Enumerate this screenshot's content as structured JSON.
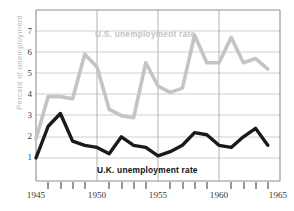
{
  "chart_data": {
    "type": "line",
    "title": "",
    "subtitle": "",
    "xlabel": "",
    "ylabel": "Percent of unemployment",
    "xlim": [
      1945,
      1965
    ],
    "ylim": [
      0.35,
      7.6
    ],
    "grid": true,
    "legend_position": "inline-annotation",
    "x": [
      1945,
      1946,
      1947,
      1948,
      1949,
      1950,
      1951,
      1952,
      1953,
      1954,
      1955,
      1956,
      1957,
      1958,
      1959,
      1960,
      1961,
      1962,
      1963,
      1964
    ],
    "xtick_labels": [
      "1945",
      "1950",
      "1955",
      "1960",
      "1965"
    ],
    "xtick_values": [
      1945,
      1950,
      1955,
      1960,
      1965
    ],
    "ytick_labels": [
      "1",
      "2",
      "3",
      "4",
      "5",
      "6",
      "7"
    ],
    "ytick_values": [
      1,
      2,
      3,
      4,
      5,
      6,
      7
    ],
    "series": [
      {
        "name": "U.S. unemployment rate",
        "color": "#c4c4c4",
        "values": [
          1.9,
          3.9,
          3.9,
          3.8,
          5.9,
          5.3,
          3.3,
          3.0,
          2.9,
          5.5,
          4.4,
          4.1,
          4.3,
          6.8,
          5.5,
          5.5,
          6.7,
          5.5,
          5.7,
          5.2
        ]
      },
      {
        "name": "U.K. unemployment rate",
        "color": "#1a1a1a",
        "values": [
          1.0,
          2.5,
          3.1,
          1.8,
          1.6,
          1.5,
          1.2,
          2.0,
          1.6,
          1.5,
          1.1,
          1.3,
          1.6,
          2.2,
          2.1,
          1.6,
          1.5,
          2.0,
          2.4,
          1.6
        ]
      }
    ],
    "annotations": [
      {
        "text": "U.S. unemployment rate",
        "series": "U.S. unemployment rate"
      },
      {
        "text": "U.K. unemployment rate",
        "series": "U.K. unemployment rate"
      }
    ]
  },
  "axis": {
    "y_title": "Percent of unemployment",
    "y_labels": [
      "7",
      "6",
      "5",
      "4",
      "3",
      "2",
      "1"
    ],
    "x_labels": [
      "1945",
      "1950",
      "1955",
      "1960",
      "1965"
    ]
  },
  "labels": {
    "us_series": "U.S. unemployment rate",
    "uk_series": "U.K. unemployment rate"
  },
  "colors": {
    "us_line": "#c4c4c4",
    "uk_line": "#1a1a1a",
    "grid": "#c9c9c9",
    "frame": "#9a9a9a",
    "text": "#3a3a3a",
    "y_title": "#b9b9b9"
  }
}
